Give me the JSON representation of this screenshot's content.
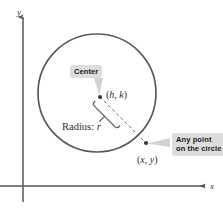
{
  "figure": {
    "type": "geometry-diagram",
    "background_color": "#ffffff"
  },
  "axes": {
    "y_label": "y",
    "x_label": "x",
    "axis_color": "#55555a",
    "origin": {
      "x": 23,
      "y": 186
    }
  },
  "circle": {
    "center": {
      "x": 97,
      "y": 93
    },
    "radius": 59,
    "stroke_color": "#5a5a5e",
    "stroke_width": 1.6
  },
  "points": [
    {
      "id": "center-point",
      "label": "(h, k)",
      "label_h": "h",
      "label_k": "k",
      "x": 100,
      "y": 97,
      "dot_color": "#3a3a3a"
    },
    {
      "id": "circle-point",
      "label": "(x, y)",
      "label_x": "x",
      "label_y": "y",
      "x": 146,
      "y": 143,
      "dot_color": "#3a3a3a"
    }
  ],
  "radius_segment": {
    "label": "Radius: r",
    "label_text": "Radius:",
    "label_var": "r",
    "dash_color": "#6e6e72",
    "brace_color": "#55555a"
  },
  "callouts": [
    {
      "id": "center-callout",
      "text": "Center",
      "background": "#dcdcdc",
      "text_color": "#1a1a1a",
      "leader_color": "#c9c9c9",
      "points_to": "center-point"
    },
    {
      "id": "any-point-callout",
      "text": "Any point on the circle",
      "line1": "Any point on",
      "line2": "the circle",
      "background": "#dcdcdc",
      "text_color": "#1a1a1a",
      "leader_color": "#c9c9c9",
      "points_to": "circle-point"
    }
  ]
}
